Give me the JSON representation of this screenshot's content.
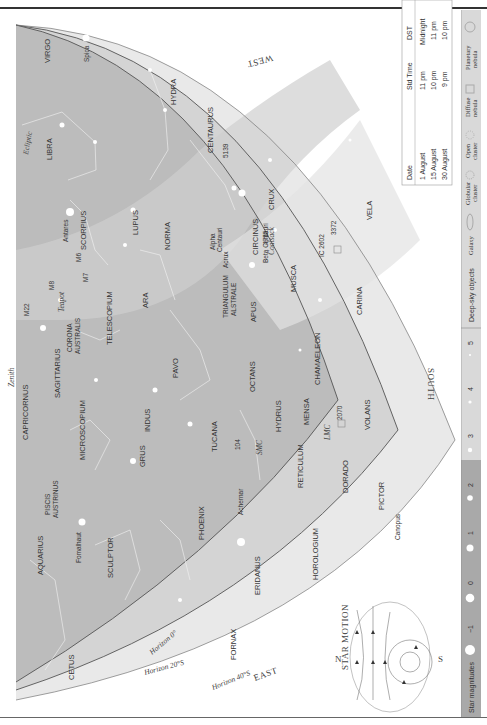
{
  "chart": {
    "directions": {
      "west": "WEST",
      "south": "SOUTH",
      "east": "EAST",
      "zenith": "Zenith"
    },
    "horizons": [
      "Horizon 0°",
      "Horizon 20°S",
      "Horizon 40°S"
    ],
    "latitude_marks": [
      "20°S",
      "40°S"
    ],
    "ecliptic": "Ecliptic",
    "constellations": [
      "VIRGO",
      "LIBRA",
      "HYDRA",
      "CENTAURUS",
      "SCORPIUS",
      "LUPUS",
      "NORMA",
      "CRUX",
      "CIRCINUS",
      "MUSCA",
      "VELA",
      "CARINA",
      "SAGITTARIUS",
      "CORONA AUSTRALIS",
      "TELESCOPIUM",
      "ARA",
      "TRIANGULUM AUSTRALE",
      "APUS",
      "CHAMAELEON",
      "VOLANS",
      "CAPRICORNUS",
      "MICROSCOPIUM",
      "INDUS",
      "PAVO",
      "OCTANS",
      "HYDRUS",
      "MENSA",
      "PISCIS AUSTRINUS",
      "GRUS",
      "TUCANA",
      "RETICULUM",
      "DORADO",
      "PICTOR",
      "AQUARIUS",
      "SCULPTOR",
      "PHOENIX",
      "HOROLOGIUM",
      "ERIDANUS",
      "FORNAX",
      "CETUS"
    ],
    "stars": [
      "Spica",
      "Antares",
      "Alpha Centauri",
      "Beta Centauri",
      "Acrux",
      "Achernar",
      "Fomalhaut",
      "Canopus"
    ],
    "deep_sky": [
      "M6",
      "M7",
      "M8",
      "M22",
      "5139",
      "4755",
      "IC 2602",
      "3372",
      "104",
      "2070"
    ],
    "other_labels": [
      "Teapot",
      "Coalsack",
      "SMC",
      "LMC"
    ]
  },
  "time_table": {
    "headers": [
      "Date",
      "Std Time",
      "DST"
    ],
    "rows": [
      [
        "1 August",
        "11 pm",
        "Midnight"
      ],
      [
        "15 August",
        "10 pm",
        "11 pm"
      ],
      [
        "30 August",
        "9 pm",
        "10 pm"
      ]
    ]
  },
  "star_motion": {
    "title": "STAR MOTION",
    "north": "N",
    "south": "S"
  },
  "legend": {
    "magnitudes_label": "Star magnitudes",
    "magnitudes": [
      "−1",
      "0",
      "1",
      "2",
      "3",
      "4",
      "5"
    ],
    "deep_sky_label": "Deep-sky objects",
    "deep_sky_types": [
      "Galaxy",
      "Globular cluster",
      "Open cluster",
      "Diffuse nebula",
      "Planetary nebula"
    ]
  }
}
